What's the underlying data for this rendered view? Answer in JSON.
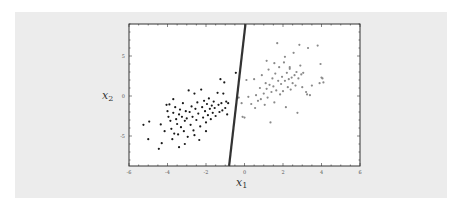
{
  "chart_data": {
    "type": "scatter",
    "title": "",
    "xlabel": "x",
    "xlabel_sub": "1",
    "ylabel": "x",
    "ylabel_sub": "2",
    "xlim": [
      -6,
      6
    ],
    "ylim": [
      -8.75,
      9
    ],
    "xticks": [
      -6,
      -4,
      -2,
      0,
      2,
      4,
      6
    ],
    "yticks": [
      -5,
      0,
      5
    ],
    "grid": false,
    "legend": null,
    "decision_boundary": {
      "x1": [
        -0.8,
        0.05
      ],
      "y": [
        -8.75,
        9
      ],
      "color": "#333333"
    },
    "series": [
      {
        "name": "class 1",
        "color": "#1a1a1a",
        "points": [
          [
            -5.25,
            -3.6
          ],
          [
            -4.95,
            -3.2
          ],
          [
            -5.0,
            -5.4
          ],
          [
            -4.45,
            -6.6
          ],
          [
            -4.35,
            -3.55
          ],
          [
            -4.3,
            -5.9
          ],
          [
            -4.15,
            -4.4
          ],
          [
            -4.05,
            -1.1
          ],
          [
            -3.95,
            -2.6
          ],
          [
            -3.9,
            -1.05
          ],
          [
            -3.85,
            -3.1
          ],
          [
            -3.8,
            -4.1
          ],
          [
            -3.75,
            -5.4
          ],
          [
            -3.7,
            -2.1
          ],
          [
            -3.65,
            -4.7
          ],
          [
            -3.6,
            -1.4
          ],
          [
            -3.55,
            -2.9
          ],
          [
            -3.5,
            -3.5
          ],
          [
            -3.45,
            -4.8
          ],
          [
            -3.4,
            -2.3
          ],
          [
            -3.4,
            -6.4
          ],
          [
            -3.35,
            -1.7
          ],
          [
            -3.3,
            -3.9
          ],
          [
            -3.25,
            -2.6
          ],
          [
            -3.2,
            -0.9
          ],
          [
            -3.15,
            -4.4
          ],
          [
            -3.1,
            -3.1
          ],
          [
            -3.05,
            -1.9
          ],
          [
            -3.0,
            -2.8
          ],
          [
            -2.95,
            -5.1
          ],
          [
            -2.9,
            0.7
          ],
          [
            -2.85,
            -2.0
          ],
          [
            -2.8,
            -3.6
          ],
          [
            -2.75,
            -1.3
          ],
          [
            -2.7,
            -2.6
          ],
          [
            -2.65,
            -4.3
          ],
          [
            -2.6,
            0.3
          ],
          [
            -2.55,
            -1.6
          ],
          [
            -2.5,
            -3.0
          ],
          [
            -2.45,
            -0.8
          ],
          [
            -2.4,
            -2.2
          ],
          [
            -2.35,
            -5.5
          ],
          [
            -2.3,
            -3.8
          ],
          [
            -2.25,
            0.8
          ],
          [
            -2.2,
            -1.4
          ],
          [
            -2.15,
            -2.7
          ],
          [
            -2.1,
            -0.6
          ],
          [
            -2.05,
            -1.9
          ],
          [
            -2.0,
            -3.3
          ],
          [
            -1.95,
            -1.0
          ],
          [
            -1.9,
            -2.4
          ],
          [
            -1.85,
            -0.3
          ],
          [
            -1.8,
            -1.6
          ],
          [
            -1.75,
            -2.9
          ],
          [
            -1.7,
            -1.2
          ],
          [
            -1.65,
            -2.1
          ],
          [
            -1.6,
            -0.7
          ],
          [
            -1.55,
            -1.5
          ],
          [
            -1.5,
            -2.5
          ],
          [
            -1.4,
            0.4
          ],
          [
            -1.35,
            -1.1
          ],
          [
            -1.3,
            -2.0
          ],
          [
            -1.25,
            2.1
          ],
          [
            -1.2,
            -0.9
          ],
          [
            -1.15,
            -1.8
          ],
          [
            -1.1,
            0.3
          ],
          [
            -1.05,
            1.7
          ],
          [
            -1.0,
            -1.5
          ],
          [
            -0.95,
            -0.7
          ],
          [
            -0.9,
            -2.3
          ],
          [
            -0.85,
            -0.9
          ],
          [
            -0.45,
            2.9
          ],
          [
            -3.7,
            -0.4
          ],
          [
            -4.0,
            -1.9
          ],
          [
            -2.0,
            -4.4
          ],
          [
            -3.1,
            -6.0
          ],
          [
            -2.6,
            -4.9
          ]
        ]
      },
      {
        "name": "class 2",
        "color": "#8a8a8a",
        "points": [
          [
            -0.3,
            -0.2
          ],
          [
            -0.15,
            -0.9
          ],
          [
            -0.1,
            -2.6
          ],
          [
            0.0,
            -2.7
          ],
          [
            0.1,
            2.0
          ],
          [
            0.2,
            -0.1
          ],
          [
            0.35,
            -1.0
          ],
          [
            0.5,
            2.1
          ],
          [
            0.6,
            0.1
          ],
          [
            0.7,
            -0.6
          ],
          [
            0.8,
            1.0
          ],
          [
            0.85,
            -0.4
          ],
          [
            0.9,
            2.6
          ],
          [
            1.0,
            0.3
          ],
          [
            1.05,
            -1.1
          ],
          [
            1.1,
            1.6
          ],
          [
            1.15,
            0.9
          ],
          [
            1.2,
            -0.2
          ],
          [
            1.25,
            3.3
          ],
          [
            1.3,
            1.4
          ],
          [
            1.35,
            -3.3
          ],
          [
            1.4,
            0.5
          ],
          [
            1.45,
            2.2
          ],
          [
            1.5,
            1.2
          ],
          [
            1.55,
            -0.8
          ],
          [
            1.6,
            2.8
          ],
          [
            1.65,
            0.7
          ],
          [
            1.7,
            6.6
          ],
          [
            1.75,
            1.9
          ],
          [
            1.8,
            3.6
          ],
          [
            1.85,
            0.2
          ],
          [
            1.9,
            1.5
          ],
          [
            1.95,
            2.4
          ],
          [
            2.0,
            0.6
          ],
          [
            2.05,
            4.2
          ],
          [
            2.1,
            1.9
          ],
          [
            2.15,
            -1.4
          ],
          [
            2.2,
            2.9
          ],
          [
            2.25,
            1.1
          ],
          [
            2.3,
            2.1
          ],
          [
            2.35,
            3.4
          ],
          [
            2.4,
            0.8
          ],
          [
            2.45,
            2.3
          ],
          [
            2.5,
            1.6
          ],
          [
            2.55,
            5.4
          ],
          [
            2.6,
            2.6
          ],
          [
            2.65,
            1.3
          ],
          [
            2.7,
            3.0
          ],
          [
            2.75,
            -2.1
          ],
          [
            2.8,
            2.2
          ],
          [
            2.85,
            6.4
          ],
          [
            2.9,
            3.8
          ],
          [
            2.95,
            2.7
          ],
          [
            3.0,
            1.1
          ],
          [
            3.05,
            2.9
          ],
          [
            3.2,
            0.5
          ],
          [
            3.3,
            6.0
          ],
          [
            3.4,
            0.1
          ],
          [
            3.5,
            1.3
          ],
          [
            3.8,
            6.3
          ],
          [
            3.9,
            1.6
          ],
          [
            3.95,
            4.0
          ],
          [
            4.0,
            2.3
          ],
          [
            4.1,
            1.7
          ],
          [
            4.05,
            2.2
          ],
          [
            3.25,
            0.2
          ],
          [
            2.1,
            4.9
          ],
          [
            1.15,
            4.4
          ],
          [
            0.55,
            -1.5
          ],
          [
            1.55,
            4.1
          ],
          [
            2.35,
            3.6
          ]
        ]
      }
    ]
  }
}
